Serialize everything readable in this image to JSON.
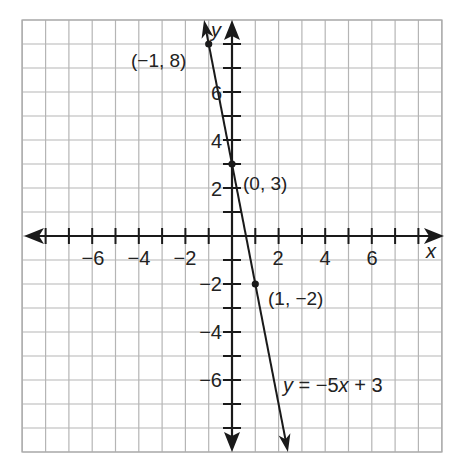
{
  "chart_data": {
    "type": "line",
    "title": "",
    "xlabel": "x",
    "ylabel": "y",
    "xlim": [
      -9,
      9
    ],
    "ylim": [
      -9,
      9
    ],
    "grid": true,
    "x_ticks": [
      -8,
      -7,
      -6,
      -5,
      -4,
      -3,
      -2,
      -1,
      1,
      2,
      3,
      4,
      5,
      6,
      7,
      8
    ],
    "y_ticks": [
      -8,
      -7,
      -6,
      -5,
      -4,
      -3,
      -2,
      -1,
      1,
      2,
      3,
      4,
      5,
      6,
      7,
      8
    ],
    "x_tick_labels": [
      {
        "value": -6,
        "label": "−6"
      },
      {
        "value": -4,
        "label": "−4"
      },
      {
        "value": -2,
        "label": "−2"
      },
      {
        "value": 2,
        "label": "2"
      },
      {
        "value": 4,
        "label": "4"
      },
      {
        "value": 6,
        "label": "6"
      }
    ],
    "y_tick_labels": [
      {
        "value": 6,
        "label": "6"
      },
      {
        "value": 4,
        "label": "4"
      },
      {
        "value": 2,
        "label": "2"
      },
      {
        "value": -2,
        "label": "−2"
      },
      {
        "value": -4,
        "label": "−4"
      },
      {
        "value": -6,
        "label": "−6"
      }
    ],
    "series": [
      {
        "name": "y = −5x + 3",
        "slope": -5,
        "intercept": 3,
        "x": [
          -1.2,
          -1,
          0,
          1,
          2.4
        ],
        "y": [
          9,
          8,
          3,
          -2,
          -9
        ]
      }
    ],
    "points": [
      {
        "x": -1,
        "y": 8,
        "label": "(−1, 8)"
      },
      {
        "x": 0,
        "y": 3,
        "label": "(0, 3)"
      },
      {
        "x": 1,
        "y": -2,
        "label": "(1, −2)"
      }
    ],
    "annotations": [
      {
        "text": "y = −5x + 3",
        "x": 2.2,
        "y": -6.2
      }
    ]
  },
  "labels": {
    "x_axis": "x",
    "y_axis": "y",
    "equation": "y = −5x + 3",
    "point_a": "(−1, 8)",
    "point_b": "(0, 3)",
    "point_c": "(1, −2)",
    "tick_xm6": "−6",
    "tick_xm4": "−4",
    "tick_xm2": "−2",
    "tick_x2": "2",
    "tick_x4": "4",
    "tick_x6": "6",
    "tick_y6": "6",
    "tick_y4": "4",
    "tick_y2": "2",
    "tick_ym2": "−2",
    "tick_ym4": "−4",
    "tick_ym6": "−6"
  }
}
